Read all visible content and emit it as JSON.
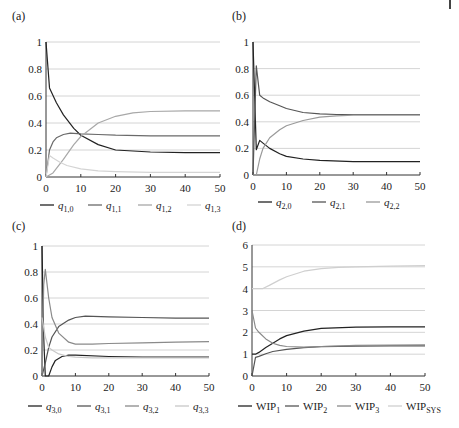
{
  "figure": {
    "panels_count": 4
  },
  "chart_data": [
    {
      "panel": "(a)",
      "type": "line",
      "xlim": [
        0,
        50
      ],
      "ylim": [
        0,
        1
      ],
      "xticks": [
        0,
        10,
        20,
        30,
        40,
        50
      ],
      "yticks": [
        0,
        0.2,
        0.4,
        0.6,
        0.8,
        1
      ],
      "ytick_labels": [
        "0",
        "0.2",
        "0.4",
        "0.6",
        "0.8",
        "1"
      ],
      "grid": "horizontal",
      "legend_position": "bottom",
      "series": [
        {
          "name": "q1,0",
          "legend_main": "q",
          "legend_sub": "1,0",
          "color": "#222222",
          "x": [
            0,
            1,
            3,
            5,
            8,
            10,
            15,
            20,
            30,
            40,
            50
          ],
          "y": [
            1.0,
            0.66,
            0.55,
            0.46,
            0.36,
            0.31,
            0.24,
            0.2,
            0.185,
            0.18,
            0.18
          ]
        },
        {
          "name": "q1,1",
          "legend_main": "q",
          "legend_sub": "1,1",
          "color": "#6a6a6a",
          "x": [
            0,
            1,
            2,
            3,
            5,
            7,
            10,
            15,
            20,
            30,
            40,
            50
          ],
          "y": [
            0.0,
            0.2,
            0.26,
            0.29,
            0.315,
            0.325,
            0.32,
            0.315,
            0.31,
            0.305,
            0.305,
            0.305
          ]
        },
        {
          "name": "q1,2",
          "legend_main": "q",
          "legend_sub": "1,2",
          "color": "#a8a8a8",
          "x": [
            0,
            2,
            5,
            8,
            10,
            15,
            20,
            25,
            30,
            40,
            50
          ],
          "y": [
            0.0,
            0.03,
            0.13,
            0.24,
            0.3,
            0.4,
            0.45,
            0.475,
            0.485,
            0.49,
            0.49
          ]
        },
        {
          "name": "q1,3",
          "legend_main": "q",
          "legend_sub": "1,3",
          "color": "#d4d4d4",
          "x": [
            0,
            1,
            2,
            4,
            6,
            10,
            15,
            20,
            30,
            40,
            50
          ],
          "y": [
            0.0,
            0.16,
            0.14,
            0.11,
            0.085,
            0.06,
            0.045,
            0.04,
            0.035,
            0.035,
            0.035
          ]
        }
      ]
    },
    {
      "panel": "(b)",
      "type": "line",
      "xlim": [
        0,
        50
      ],
      "ylim": [
        0,
        1
      ],
      "xticks": [
        0,
        10,
        20,
        30,
        40,
        50
      ],
      "yticks": [
        0,
        0.2,
        0.4,
        0.6,
        0.8,
        1
      ],
      "ytick_labels": [
        "0",
        "0.2",
        "0.4",
        "0.6",
        "0.8",
        "1"
      ],
      "grid": "horizontal",
      "legend_position": "bottom",
      "series": [
        {
          "name": "q2,0",
          "legend_main": "q",
          "legend_sub": "2,0",
          "color": "#222222",
          "x": [
            0,
            1,
            2,
            3,
            5,
            8,
            10,
            15,
            20,
            30,
            40,
            50
          ],
          "y": [
            1.0,
            0.19,
            0.26,
            0.24,
            0.2,
            0.16,
            0.14,
            0.12,
            0.11,
            0.1,
            0.1,
            0.1
          ]
        },
        {
          "name": "q2,1",
          "legend_main": "q",
          "legend_sub": "2,1",
          "color": "#555555",
          "x": [
            0,
            1,
            2,
            3,
            5,
            8,
            10,
            15,
            20,
            25,
            30,
            40,
            50
          ],
          "y": [
            0.0,
            0.82,
            0.6,
            0.58,
            0.55,
            0.52,
            0.5,
            0.47,
            0.46,
            0.455,
            0.455,
            0.455,
            0.455
          ]
        },
        {
          "name": "q2,2",
          "legend_main": "q",
          "legend_sub": "2,2",
          "color": "#9a9a9a",
          "x": [
            0,
            1,
            2,
            3,
            5,
            8,
            10,
            15,
            20,
            25,
            30,
            40,
            50
          ],
          "y": [
            0.0,
            0.0,
            0.12,
            0.2,
            0.28,
            0.34,
            0.37,
            0.41,
            0.435,
            0.445,
            0.45,
            0.45,
            0.45
          ]
        }
      ]
    },
    {
      "panel": "(c)",
      "type": "line",
      "xlim": [
        0,
        50
      ],
      "ylim": [
        0,
        1
      ],
      "xticks": [
        0,
        10,
        20,
        30,
        40,
        50
      ],
      "yticks": [
        0,
        0.2,
        0.4,
        0.6,
        0.8,
        1
      ],
      "ytick_labels": [
        "0",
        "0.2",
        "0.4",
        "0.6",
        "0.8",
        "1"
      ],
      "grid": "horizontal",
      "legend_position": "bottom",
      "series": [
        {
          "name": "q3,0",
          "legend_main": "q",
          "legend_sub": "3,0",
          "color": "#222222",
          "x": [
            0,
            0.5,
            1,
            2,
            3,
            4,
            6,
            8,
            10,
            20,
            30,
            40,
            50
          ],
          "y": [
            1.0,
            0.3,
            0.0,
            0.0,
            0.07,
            0.12,
            0.15,
            0.16,
            0.16,
            0.15,
            0.145,
            0.145,
            0.145
          ]
        },
        {
          "name": "q3,1",
          "legend_main": "q",
          "legend_sub": "3,1",
          "color": "#555555",
          "x": [
            0,
            1,
            2,
            3,
            5,
            8,
            10,
            13,
            20,
            30,
            40,
            50
          ],
          "y": [
            0.0,
            0.1,
            0.22,
            0.3,
            0.38,
            0.43,
            0.45,
            0.46,
            0.455,
            0.45,
            0.445,
            0.445
          ]
        },
        {
          "name": "q3,2",
          "legend_main": "q",
          "legend_sub": "3,2",
          "color": "#8a8a8a",
          "x": [
            0,
            0.5,
            1,
            2,
            3,
            5,
            8,
            10,
            15,
            20,
            30,
            40,
            50
          ],
          "y": [
            0.0,
            0.7,
            0.82,
            0.6,
            0.45,
            0.33,
            0.26,
            0.245,
            0.245,
            0.25,
            0.255,
            0.26,
            0.265
          ]
        },
        {
          "name": "q3,3",
          "legend_main": "q",
          "legend_sub": "3,3",
          "color": "#c8c8c8",
          "x": [
            0,
            1,
            2,
            3,
            5,
            8,
            10,
            15,
            20,
            30,
            40,
            50
          ],
          "y": [
            0.45,
            0.3,
            0.22,
            0.2,
            0.17,
            0.15,
            0.145,
            0.14,
            0.14,
            0.14,
            0.14,
            0.14
          ]
        }
      ]
    },
    {
      "panel": "(d)",
      "type": "line",
      "xlim": [
        0,
        50
      ],
      "ylim": [
        0,
        6
      ],
      "xticks": [
        0,
        10,
        20,
        30,
        40,
        50
      ],
      "yticks": [
        0,
        1,
        2,
        3,
        4,
        5,
        6
      ],
      "ytick_labels": [
        "0",
        "1",
        "2",
        "3",
        "4",
        "5",
        "6"
      ],
      "grid": "horizontal",
      "legend_position": "bottom",
      "series": [
        {
          "name": "WIP1",
          "legend_main": "WIP",
          "legend_sub": "1",
          "color": "#222222",
          "x": [
            0,
            1,
            2,
            4,
            6,
            8,
            10,
            15,
            20,
            30,
            40,
            50
          ],
          "y": [
            1.0,
            1.0,
            1.08,
            1.3,
            1.5,
            1.7,
            1.85,
            2.05,
            2.18,
            2.24,
            2.25,
            2.25
          ]
        },
        {
          "name": "WIP2",
          "legend_main": "WIP",
          "legend_sub": "2",
          "color": "#555555",
          "x": [
            0,
            1,
            2,
            4,
            6,
            10,
            15,
            20,
            30,
            40,
            50
          ],
          "y": [
            0.0,
            0.85,
            0.9,
            1.02,
            1.12,
            1.22,
            1.3,
            1.34,
            1.37,
            1.38,
            1.38
          ]
        },
        {
          "name": "WIP3",
          "legend_main": "WIP",
          "legend_sub": "3",
          "color": "#8a8a8a",
          "x": [
            0,
            1,
            2,
            4,
            6,
            8,
            10,
            15,
            20,
            30,
            40,
            50
          ],
          "y": [
            3.0,
            2.2,
            2.0,
            1.7,
            1.5,
            1.4,
            1.35,
            1.32,
            1.35,
            1.4,
            1.42,
            1.43
          ]
        },
        {
          "name": "WIPSYS",
          "legend_main": "WIP",
          "legend_sub": "SYS",
          "color": "#cfcfcf",
          "x": [
            0,
            3,
            5,
            8,
            10,
            15,
            20,
            25,
            30,
            40,
            50
          ],
          "y": [
            4.0,
            4.0,
            4.15,
            4.4,
            4.55,
            4.8,
            4.92,
            4.98,
            5.0,
            5.03,
            5.05
          ]
        }
      ]
    }
  ],
  "layout": [
    {
      "label_xy": [
        12,
        20
      ],
      "x0": 46,
      "x1": 220,
      "yTop": 42,
      "yBot": 177,
      "xlabelY": 192,
      "legendY": 209,
      "legendX": [
        40,
        88,
        138,
        187
      ]
    },
    {
      "label_xy": [
        232,
        20
      ],
      "x0": 253,
      "x1": 420,
      "yTop": 42,
      "yBot": 175,
      "xlabelY": 190,
      "legendY": 206,
      "legendX": [
        258,
        312,
        366
      ]
    },
    {
      "label_xy": [
        12,
        230
      ],
      "x0": 42,
      "x1": 209,
      "yTop": 246,
      "yBot": 376,
      "xlabelY": 391,
      "legendY": 410,
      "legendX": [
        28,
        77,
        125,
        175
      ]
    },
    {
      "label_xy": [
        232,
        230
      ],
      "x0": 252,
      "x1": 425,
      "yTop": 245,
      "yBot": 376,
      "xlabelY": 391,
      "legendY": 410,
      "legendX": [
        238,
        285,
        337,
        388
      ]
    }
  ]
}
